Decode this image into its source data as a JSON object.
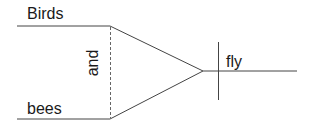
{
  "diagram": {
    "type": "syntax-tree (Reed-Kellogg sentence diagram)",
    "subjects": [
      "Birds",
      "bees"
    ],
    "conjunction": "and",
    "predicate": "fly",
    "line_color": "#333333"
  }
}
